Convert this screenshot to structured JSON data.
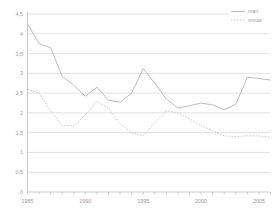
{
  "chart_data": {
    "type": "line",
    "title": "",
    "subtitle": "",
    "xlabel": "",
    "ylabel": "",
    "x": [
      1985,
      1986,
      1987,
      1988,
      1989,
      1990,
      1991,
      1992,
      1993,
      1994,
      1995,
      1996,
      1997,
      1998,
      1999,
      2000,
      2001,
      2002,
      2003,
      2004,
      2005,
      2006
    ],
    "series": [
      {
        "name": "man",
        "style": "solid",
        "color": "#b0b0b0",
        "values": [
          4.25,
          3.75,
          3.65,
          2.92,
          2.7,
          2.42,
          2.65,
          2.32,
          2.27,
          2.5,
          3.12,
          2.75,
          2.35,
          2.12,
          2.18,
          2.25,
          2.2,
          2.08,
          2.22,
          2.9,
          2.87,
          2.83
        ]
      },
      {
        "name": "vrouw",
        "style": "dotted",
        "color": "#c0c0c0",
        "values": [
          2.6,
          2.5,
          2.05,
          1.68,
          1.68,
          1.95,
          2.28,
          2.12,
          1.72,
          1.5,
          1.42,
          1.75,
          2.05,
          2.0,
          1.85,
          1.68,
          1.55,
          1.42,
          1.4,
          1.42,
          1.42,
          1.38
        ]
      }
    ],
    "xlim": [
      1985,
      2006
    ],
    "ylim": [
      0,
      4.5
    ],
    "ytick_labels": [
      "4,5",
      "4",
      "3,5",
      "3",
      "2,5",
      "2",
      "1,5",
      "1",
      "0,5",
      "0"
    ],
    "ytick_values": [
      4.5,
      4,
      3.5,
      3,
      2.5,
      2,
      1.5,
      1,
      0.5,
      0
    ],
    "xtick_labels": [
      "1985",
      "1990",
      "1995",
      "2000",
      "2005"
    ],
    "xtick_values": [
      1985,
      1990,
      1995,
      2000,
      2005
    ],
    "grid": "horizontal",
    "legend_position": "top-right",
    "legend": [
      "man",
      "vrouw"
    ]
  }
}
